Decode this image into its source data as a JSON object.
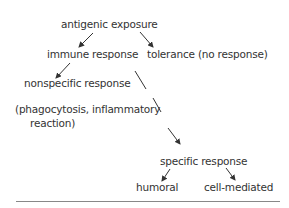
{
  "nodes": {
    "root": "antigenic exposure",
    "immune": "immune response",
    "tolerance": "tolerance (no response)",
    "nonspecific": "nonspecific response",
    "nonspecific_detail_1": "(phagocytosis, inflammatory",
    "nonspecific_detail_2": "reaction)",
    "specific": "specific response",
    "humoral": "humoral",
    "cell_mediated": "cell-mediated"
  },
  "edges": [
    {
      "from": "antigenic exposure",
      "to": "immune response"
    },
    {
      "from": "antigenic exposure",
      "to": "tolerance (no response)"
    },
    {
      "from": "immune response",
      "to": "nonspecific response"
    },
    {
      "from": "immune response",
      "to": "specific response"
    },
    {
      "from": "specific response",
      "to": "humoral"
    },
    {
      "from": "specific response",
      "to": "cell-mediated"
    }
  ],
  "colors": {
    "text": "#333333",
    "arrow": "#333333",
    "rule": "#888888"
  }
}
